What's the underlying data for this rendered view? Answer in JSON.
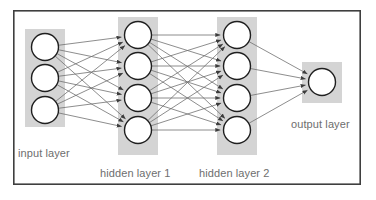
{
  "diagram": {
    "frame": {
      "x": 13,
      "y": 10,
      "width": 348,
      "height": 175,
      "border_color": "#3f3f3f",
      "background_color": "#ffffff",
      "border_width": 1.6
    },
    "colors": {
      "band": "#d4d4d4",
      "node_fill": "#ffffff",
      "node_stroke": "#1f1f1f",
      "edge": "#707070",
      "arrow": "#3c3c3c",
      "label_text": "#6e6e6e",
      "frame_border": "#3f3f3f",
      "page_background": "#ffffff"
    },
    "geometry": {
      "node_radius": 13.5,
      "node_stroke_width": 1.4,
      "edge_width": 0.8,
      "band_radius": 0
    },
    "layers": [
      {
        "id": "input",
        "label": "input layer",
        "node_count": 3,
        "center_x": 45,
        "node_y": [
          47,
          78,
          110
        ],
        "band": {
          "x": 25,
          "y": 29,
          "width": 40,
          "height": 98
        },
        "label_position": {
          "x": 18,
          "y": 157,
          "anchor": "start"
        }
      },
      {
        "id": "hidden-1",
        "label": "hidden layer 1",
        "node_count": 4,
        "center_x": 138,
        "node_y": [
          35,
          66,
          98,
          130
        ],
        "band": {
          "x": 118,
          "y": 17,
          "width": 40,
          "height": 138
        },
        "label_position": {
          "x": 100,
          "y": 177,
          "anchor": "start"
        }
      },
      {
        "id": "hidden-2",
        "label": "hidden layer 2",
        "node_count": 4,
        "center_x": 237,
        "node_y": [
          35,
          66,
          98,
          130
        ],
        "band": {
          "x": 217,
          "y": 17,
          "width": 40,
          "height": 138
        },
        "label_position": {
          "x": 199,
          "y": 177,
          "anchor": "start"
        }
      },
      {
        "id": "output",
        "label": "output layer",
        "node_count": 1,
        "center_x": 322,
        "node_y": [
          82
        ],
        "band": {
          "x": 302,
          "y": 62,
          "width": 40,
          "height": 41
        },
        "label_position": {
          "x": 291,
          "y": 128,
          "anchor": "start"
        }
      }
    ],
    "connections": [
      {
        "from": "input",
        "to": "hidden-1",
        "fully_connected": true,
        "edge_count": 12
      },
      {
        "from": "hidden-1",
        "to": "hidden-2",
        "fully_connected": true,
        "edge_count": 16
      },
      {
        "from": "hidden-2",
        "to": "output",
        "fully_connected": true,
        "edge_count": 4
      }
    ]
  }
}
